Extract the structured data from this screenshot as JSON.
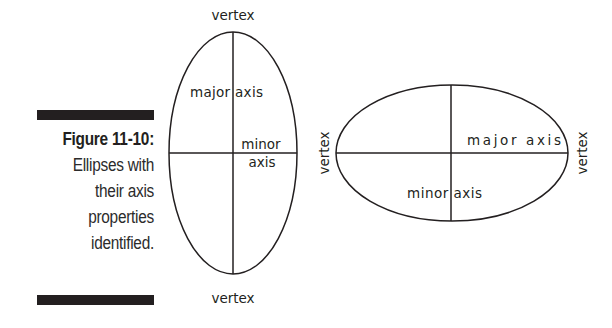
{
  "caption": {
    "figure_label": "Figure 11-10:",
    "lines": [
      "Ellipses with",
      "their axis",
      "properties",
      "identified."
    ]
  },
  "vertical_ellipse": {
    "orientation": "vertical",
    "center": [
      233,
      153
    ],
    "rx": 64,
    "ry": 121,
    "labels": {
      "top_vertex": "vertex",
      "bottom_vertex": "vertex",
      "major_axis": "major axis",
      "minor_axis_line1": "minor",
      "minor_axis_line2": "axis"
    }
  },
  "horizontal_ellipse": {
    "orientation": "horizontal",
    "center": [
      452,
      153
    ],
    "rx": 116,
    "ry": 68,
    "labels": {
      "left_vertex": "vertex",
      "right_vertex": "vertex",
      "major_axis": "major axis",
      "minor_axis": "minor axis"
    }
  },
  "colors": {
    "ink": "#231f20",
    "background": "#ffffff"
  }
}
